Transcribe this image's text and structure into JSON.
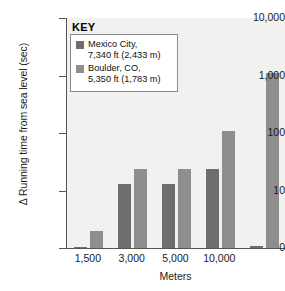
{
  "chart_data": {
    "type": "bar",
    "title": "",
    "xlabel": "Meters",
    "ylabel": "Δ Running time from sea level (sec)",
    "scale": "log",
    "grid": false,
    "legend_position": "top-left-inside",
    "categories": [
      "1,500",
      "3,000",
      "5,000",
      "10,000",
      ""
    ],
    "ytick_labels": [
      "10,000",
      "1,000",
      "100",
      "10",
      "0"
    ],
    "ytick_values": [
      10000,
      1000,
      100,
      10,
      0
    ],
    "ylim": [
      0,
      10000
    ],
    "series": [
      {
        "name": "Mexico City, 7,340 ft (2,433 m)",
        "color": "#6e6e6e",
        "values": [
          0.2,
          13,
          13,
          24,
          0.3
        ]
      },
      {
        "name": "Boulder, CO, 5,350 ft (1,783 m)",
        "color": "#8e8e8e",
        "values": [
          3,
          24,
          24,
          110,
          1100
        ]
      }
    ]
  },
  "legend": {
    "key_label": "KEY",
    "entries": [
      {
        "swatch": "dark",
        "line1": "Mexico City,",
        "line2": "7,340 ft (2,433 m)"
      },
      {
        "swatch": "light",
        "line1": "Boulder, CO,",
        "line2": "5,350 ft (1,783 m)"
      }
    ]
  }
}
